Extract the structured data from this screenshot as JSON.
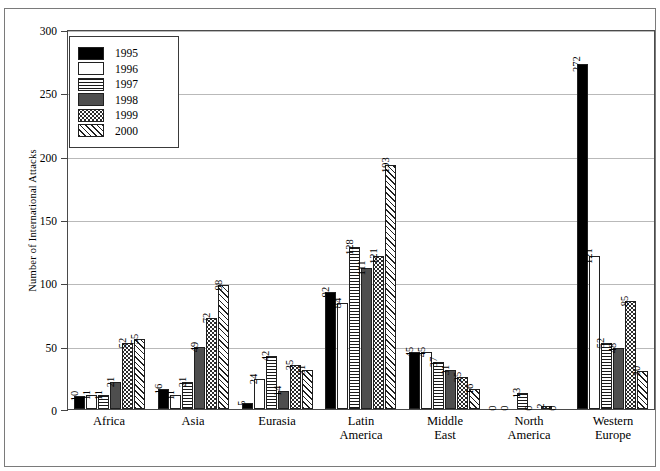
{
  "figure": {
    "top_caption": "",
    "ylabel": "Number of International Attacks"
  },
  "chart_data": {
    "type": "bar",
    "title": "",
    "xlabel": "",
    "ylabel": "Number of International Attacks",
    "ylim": [
      0,
      300
    ],
    "yticks": [
      0,
      50,
      100,
      150,
      200,
      250,
      300
    ],
    "grid": true,
    "legend_position": "top-left",
    "categories": [
      "Africa",
      "Asia",
      "Eurasia",
      "Latin America",
      "Middle East",
      "North America",
      "Western Europe"
    ],
    "series": [
      {
        "name": "1995",
        "pattern": "solid-black",
        "values": [
          10,
          16,
          5,
          92,
          45,
          0,
          272
        ]
      },
      {
        "name": "1996",
        "pattern": "white",
        "values": [
          11,
          11,
          24,
          84,
          45,
          0,
          121
        ]
      },
      {
        "name": "1997",
        "pattern": "horizontal-lines",
        "values": [
          11,
          21,
          42,
          128,
          37,
          13,
          52
        ]
      },
      {
        "name": "1998",
        "pattern": "solid-gray",
        "values": [
          21,
          49,
          14,
          111,
          31,
          0,
          48
        ]
      },
      {
        "name": "1999",
        "pattern": "dotted",
        "values": [
          52,
          72,
          35,
          121,
          25,
          2,
          85
        ]
      },
      {
        "name": "2000",
        "pattern": "diagonal-hatch",
        "values": [
          55,
          98,
          31,
          193,
          16,
          0,
          30
        ]
      }
    ]
  },
  "legend": {
    "items": [
      {
        "label": "1995"
      },
      {
        "label": "1996"
      },
      {
        "label": "1997"
      },
      {
        "label": "1998"
      },
      {
        "label": "1999"
      },
      {
        "label": "2000"
      }
    ]
  }
}
